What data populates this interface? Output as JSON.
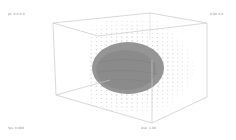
{
  "viewer": {
    "labels": {
      "top_left": "pt: 0.0 0.0",
      "top_right": "0.00 0.0",
      "bottom_left": "fps: 0.000",
      "bottom_center": "dist: 1.00"
    },
    "colors": {
      "background": "#ffffff",
      "box_edges": "#c8c8c8",
      "vector_dots": "#9a9a9a",
      "blob_fill": "#8f8f8f",
      "blob_shade": "#7a7a7a"
    },
    "box": {
      "back_top_left": [
        53,
        23
      ],
      "back_top_right": [
        207,
        23
      ],
      "front_top_left": [
        98,
        36
      ],
      "back_bottom_left": [
        56,
        95
      ],
      "back_bottom_right": [
        207,
        97
      ],
      "front_bottom": [
        152,
        123
      ],
      "top_far": [
        150,
        13
      ]
    },
    "blob": {
      "cx": 128,
      "cy": 68,
      "rx": 36,
      "ry": 26
    }
  }
}
